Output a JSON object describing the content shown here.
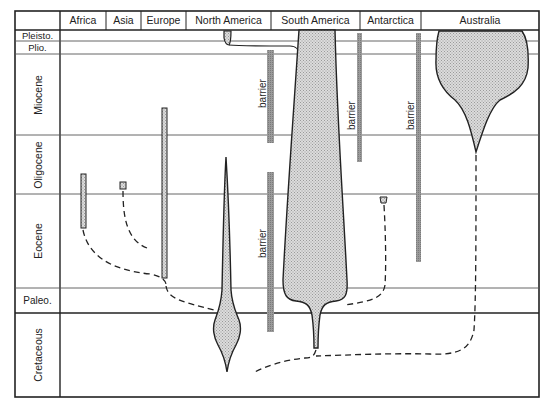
{
  "continents": [
    {
      "label": "Africa"
    },
    {
      "label": "Asia"
    },
    {
      "label": "Europe"
    },
    {
      "label": "North America"
    },
    {
      "label": "South America"
    },
    {
      "label": "Antarctica"
    },
    {
      "label": "Australia"
    }
  ],
  "periods": [
    {
      "label": "Pleisto."
    },
    {
      "label": "Plio."
    },
    {
      "label": "Miocene"
    },
    {
      "label": "Oligocene"
    },
    {
      "label": "Eocene"
    },
    {
      "label": "Paleo."
    },
    {
      "label": "Cretaceous"
    }
  ],
  "barriers": [
    {
      "label": "barrier"
    },
    {
      "label": "barrier"
    },
    {
      "label": "barrier"
    },
    {
      "label": "barrier"
    }
  ],
  "colors": {
    "line": "#222222",
    "grid": "#555555",
    "fill": "#cfcfcf",
    "barrier": "#8a8a8a"
  }
}
